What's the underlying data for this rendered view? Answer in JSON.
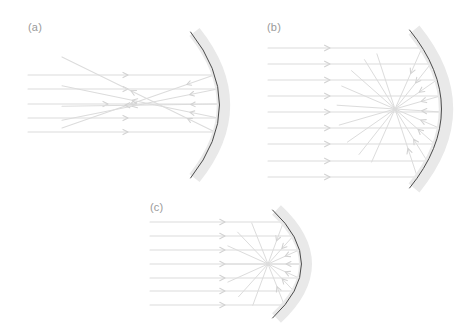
{
  "figure": {
    "type": "optics-ray-diagram",
    "caption_panels": 3,
    "background_color": "#ffffff",
    "colors": {
      "ray": "#dcdcdc",
      "ray_strong": "#d2d2d2",
      "mirror_body": "#e9e9e9",
      "mirror_surface": "#4a4a4a",
      "label": "#9a9a9a"
    },
    "panels": [
      {
        "id": "a",
        "label": "(a)",
        "label_x": 28,
        "label_y": 31,
        "description": "Spherical concave mirror with wide beam showing spherical aberration: reflected rays cross the axis at different points instead of a single focus.",
        "mirror": {
          "name": "spherical-concave-mirror",
          "top_x": 190,
          "top_y": 32,
          "bottom_x": 190,
          "bottom_y": 178,
          "apex_x": 219,
          "apex_y": 105,
          "thickness": 9,
          "surface_side": "left"
        },
        "axis_y": 105,
        "incoming_rays": [
          {
            "y": 75,
            "x_start": 28,
            "x_end": 172,
            "arrow_x": 128
          },
          {
            "y": 89,
            "x_start": 28,
            "x_end": 182,
            "arrow_x": 128
          },
          {
            "y": 104,
            "x_start": 28,
            "x_end": 190,
            "arrow_x": 108
          },
          {
            "y": 118,
            "x_start": 28,
            "x_end": 182,
            "arrow_x": 128
          },
          {
            "y": 132,
            "x_start": 28,
            "x_end": 172,
            "arrow_x": 128
          }
        ],
        "aberration_crossings": [
          128,
          138,
          148,
          155,
          160
        ],
        "reflected_rays": [
          {
            "from_x": 172,
            "from_y": 75,
            "to_x": 66,
            "to_y": 145,
            "arrow_t": 0.55
          },
          {
            "from_x": 182,
            "from_y": 89,
            "to_x": 72,
            "to_y": 133,
            "arrow_t": 0.55
          },
          {
            "from_x": 190,
            "from_y": 104,
            "to_x": 104,
            "to_y": 106,
            "arrow_t": 0.6
          },
          {
            "from_x": 182,
            "from_y": 118,
            "to_x": 72,
            "to_y": 74,
            "arrow_t": 0.55
          },
          {
            "from_x": 172,
            "from_y": 132,
            "to_x": 66,
            "to_y": 62,
            "arrow_t": 0.55
          }
        ]
      },
      {
        "id": "b",
        "label": "(b)",
        "label_x": 267,
        "label_y": 31,
        "description": "Parabolic concave mirror with large aperture: all nine parallel rays converge to one sharp focal point.",
        "mirror": {
          "name": "parabolic-concave-mirror",
          "top_x": 409,
          "top_y": 30,
          "bottom_x": 409,
          "bottom_y": 188,
          "apex_x": 441,
          "apex_y": 109,
          "thickness": 10,
          "surface_side": "left"
        },
        "axis_y": 109,
        "focus_x": 395,
        "focus_y": 109,
        "incoming_rays": [
          {
            "y": 48,
            "x_start": 268,
            "arrow_x": 330
          },
          {
            "y": 64,
            "x_start": 268,
            "arrow_x": 330
          },
          {
            "y": 80,
            "x_start": 268,
            "arrow_x": 330
          },
          {
            "y": 96,
            "x_start": 268,
            "arrow_x": 330
          },
          {
            "y": 112,
            "x_start": 268,
            "arrow_x": 330
          },
          {
            "y": 128,
            "x_start": 268,
            "arrow_x": 330
          },
          {
            "y": 144,
            "x_start": 268,
            "arrow_x": 330
          },
          {
            "y": 161,
            "x_start": 268,
            "arrow_x": 330
          },
          {
            "y": 177,
            "x_start": 268,
            "arrow_x": 330
          }
        ],
        "reflected_overshoot": 58
      },
      {
        "id": "c",
        "label": "(c)",
        "label_x": 150,
        "label_y": 211,
        "description": "Small-aperture concave mirror: the narrow parallel beam of seven rays reflects to a single focus near the mirror.",
        "mirror": {
          "name": "small-aperture-concave-mirror",
          "top_x": 272,
          "top_y": 210,
          "bottom_x": 272,
          "bottom_y": 318,
          "apex_x": 301,
          "apex_y": 264,
          "thickness": 9,
          "surface_side": "left"
        },
        "axis_y": 264,
        "focus_x": 268,
        "focus_y": 264,
        "incoming_rays": [
          {
            "y": 222,
            "x_start": 150,
            "arrow_x": 225
          },
          {
            "y": 236,
            "x_start": 150,
            "arrow_x": 225
          },
          {
            "y": 250,
            "x_start": 150,
            "arrow_x": 225
          },
          {
            "y": 264,
            "x_start": 150,
            "arrow_x": 225
          },
          {
            "y": 278,
            "x_start": 150,
            "arrow_x": 225
          },
          {
            "y": 291,
            "x_start": 150,
            "arrow_x": 225
          },
          {
            "y": 305,
            "x_start": 150,
            "arrow_x": 225
          }
        ],
        "reflected_overshoot": 44
      }
    ]
  }
}
